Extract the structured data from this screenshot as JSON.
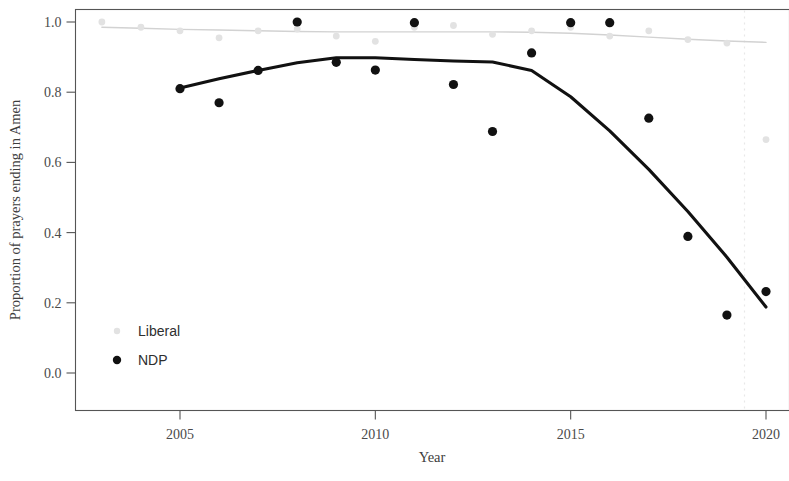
{
  "chart_data": {
    "type": "scatter",
    "title": "",
    "xlabel": "Year",
    "ylabel": "Proportion of prayers ending in Amen",
    "xlim": [
      2003,
      2020.6
    ],
    "ylim": [
      0.0,
      1.03
    ],
    "xticks": [
      2005,
      2010,
      2015,
      2020
    ],
    "xtick_labels": [
      "2005",
      "2010",
      "2015",
      "2020"
    ],
    "yticks": [
      0.0,
      0.2,
      0.4,
      0.6,
      0.8,
      1.0
    ],
    "ytick_labels": [
      "0.0",
      "0.2",
      "0.4",
      "0.6",
      "0.8",
      "1.0"
    ],
    "grid": false,
    "legend_position": "bottom-left",
    "series": [
      {
        "name": "Liberal",
        "color": "#e2e2e2",
        "marker": "filled-circle",
        "x": [
          2003,
          2004,
          2005,
          2006,
          2007,
          2008,
          2009,
          2010,
          2011,
          2012,
          2013,
          2014,
          2015,
          2016,
          2017,
          2018,
          2019,
          2020
        ],
        "y": [
          1.0,
          0.985,
          0.975,
          0.955,
          0.975,
          0.98,
          0.96,
          0.945,
          0.985,
          0.99,
          0.965,
          0.975,
          0.985,
          0.96,
          0.975,
          0.95,
          0.94,
          0.665
        ],
        "fit_x": [
          2003,
          2004,
          2005,
          2006,
          2007,
          2008,
          2009,
          2010,
          2011,
          2012,
          2013,
          2014,
          2015,
          2016,
          2017,
          2018,
          2019,
          2020
        ],
        "fit_y": [
          0.985,
          0.982,
          0.979,
          0.977,
          0.975,
          0.973,
          0.972,
          0.972,
          0.972,
          0.972,
          0.972,
          0.971,
          0.968,
          0.963,
          0.957,
          0.951,
          0.946,
          0.942
        ]
      },
      {
        "name": "NDP",
        "color": "#111111",
        "marker": "filled-circle",
        "x": [
          2005,
          2006,
          2007,
          2008,
          2009,
          2010,
          2011,
          2012,
          2013,
          2014,
          2015,
          2016,
          2017,
          2018,
          2019,
          2020
        ],
        "y": [
          0.81,
          0.77,
          0.862,
          1.0,
          0.885,
          0.863,
          0.998,
          0.822,
          0.688,
          0.912,
          0.998,
          0.998,
          0.726,
          0.389,
          0.165,
          0.232
        ],
        "fit_x": [
          2005,
          2006,
          2007,
          2008,
          2009,
          2010,
          2011,
          2012,
          2013,
          2014,
          2015,
          2016,
          2017,
          2018,
          2019,
          2020
        ],
        "fit_y": [
          0.812,
          0.838,
          0.862,
          0.884,
          0.898,
          0.898,
          0.893,
          0.889,
          0.886,
          0.862,
          0.787,
          0.69,
          0.58,
          0.46,
          0.33,
          0.188
        ]
      }
    ],
    "annotations": [
      {
        "type": "vertical-dashed-line",
        "x": 2019.45,
        "color": "#e8e8e8"
      }
    ]
  },
  "legend": {
    "entries": [
      {
        "label": "Liberal",
        "color": "#e2e2e2"
      },
      {
        "label": "NDP",
        "color": "#111111"
      }
    ]
  }
}
